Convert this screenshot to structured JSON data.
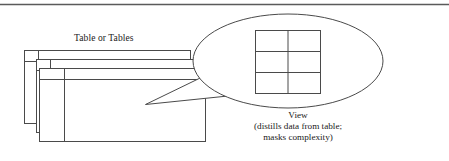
{
  "figure": {
    "top_rule": "horizontal-rule",
    "stroke_color": "#4a4a4a",
    "background_color": "#ffffff",
    "text_color": "#1a1a1a"
  },
  "table_stack": {
    "label": "Table or Tables",
    "count": 3,
    "description": "three overlapping table rectangles, each with a header row and a left key column"
  },
  "view_bubble": {
    "shape": "ellipse-callout",
    "grid": {
      "columns": 2,
      "rows": 3,
      "cells": 6
    }
  },
  "view_caption": {
    "line1": "View",
    "line2": "(distills data from table;",
    "line3": "masks complexity)"
  }
}
